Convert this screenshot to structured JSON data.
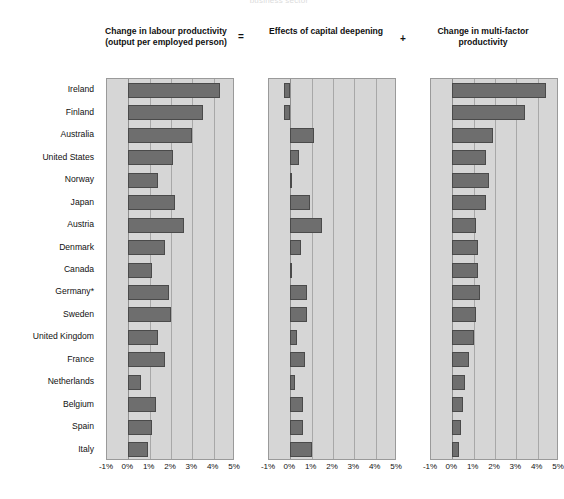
{
  "supertitle": "business sector",
  "operators": {
    "equals": "=",
    "plus": "+"
  },
  "panels": [
    {
      "title": "Change in labour productivity\n(output per employed person)",
      "title_line1": "Change in labour productivity",
      "title_line2": "(output per employed person)"
    },
    {
      "title": "Effects of capital deepening",
      "title_line1": "Effects of capital deepening",
      "title_line2": ""
    },
    {
      "title": "Change in multi-factor productivity",
      "title_line1": "Change in multi-factor",
      "title_line2": "productivity"
    }
  ],
  "axis": {
    "ticks": [
      "-1%",
      "0%",
      "1%",
      "2%",
      "3%",
      "4%",
      "5%"
    ],
    "tick_values": [
      -1,
      0,
      1,
      2,
      3,
      4,
      5
    ],
    "min": -1,
    "max": 5
  },
  "countries": [
    "Ireland",
    "Finland",
    "Australia",
    "United States",
    "Norway",
    "Japan",
    "Austria",
    "Denmark",
    "Canada",
    "Germany*",
    "Sweden",
    "United Kingdom",
    "France",
    "Netherlands",
    "Belgium",
    "Spain",
    "Italy"
  ],
  "colors": {
    "bar_fill": "#6e6e6e",
    "bar_stroke": "#4a4a4a",
    "plot_background": "#d6d6d6",
    "gridline": "#a8a8a8",
    "text": "#111111"
  },
  "chart_data": {
    "type": "bar",
    "orientation": "horizontal",
    "title": "business sector",
    "xlabel": "",
    "ylabel": "",
    "xlim": [
      -1,
      5
    ],
    "grid": true,
    "legend": false,
    "categories": [
      "Ireland",
      "Finland",
      "Australia",
      "United States",
      "Norway",
      "Japan",
      "Austria",
      "Denmark",
      "Canada",
      "Germany*",
      "Sweden",
      "United Kingdom",
      "France",
      "Netherlands",
      "Belgium",
      "Spain",
      "Italy"
    ],
    "series": [
      {
        "name": "Change in labour productivity (output per employed person)",
        "panel": 1,
        "values": [
          4.3,
          3.5,
          3.0,
          2.1,
          1.4,
          2.2,
          2.6,
          1.7,
          1.1,
          1.9,
          2.0,
          1.4,
          1.7,
          0.6,
          1.3,
          1.1,
          0.9
        ]
      },
      {
        "name": "Effects of capital deepening",
        "panel": 2,
        "values": [
          -0.3,
          -0.3,
          1.1,
          0.4,
          0.1,
          0.9,
          1.5,
          0.5,
          0.05,
          0.8,
          0.8,
          0.3,
          0.7,
          0.2,
          0.6,
          0.6,
          1.0
        ]
      },
      {
        "name": "Change in multi-factor productivity",
        "panel": 3,
        "values": [
          4.4,
          3.4,
          1.9,
          1.6,
          1.7,
          1.6,
          1.1,
          1.2,
          1.2,
          1.3,
          1.1,
          1.0,
          0.8,
          0.6,
          0.5,
          0.4,
          0.3
        ]
      }
    ]
  }
}
